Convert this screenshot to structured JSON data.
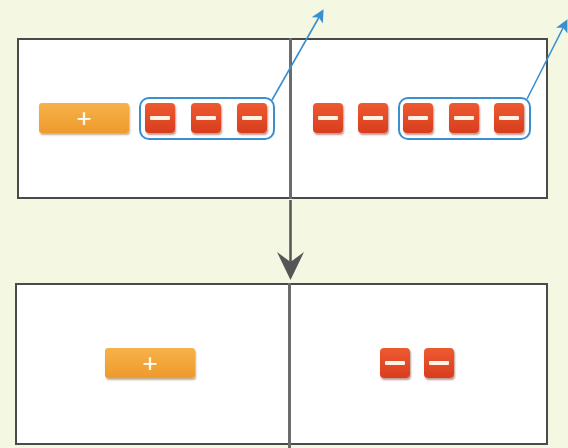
{
  "diagram": {
    "colors": {
      "background": "#f4f7e1",
      "panel": "#ffffff",
      "panel_border": "#4a4a4a",
      "positive_tile": "#f2a43a",
      "negative_tile": "#e04a25",
      "group_outline": "#3a8fd0",
      "flow_arrow": "#555555"
    },
    "before": {
      "left_side": {
        "tiles": [
          {
            "type": "x",
            "sign": "+",
            "label": "+"
          },
          {
            "type": "unit",
            "sign": "-",
            "label": "−"
          },
          {
            "type": "unit",
            "sign": "-",
            "label": "−"
          },
          {
            "type": "unit",
            "sign": "-",
            "label": "−"
          }
        ],
        "circled_count": 3
      },
      "right_side": {
        "tiles": [
          {
            "type": "unit",
            "sign": "-",
            "label": "−"
          },
          {
            "type": "unit",
            "sign": "-",
            "label": "−"
          },
          {
            "type": "unit",
            "sign": "-",
            "label": "−"
          },
          {
            "type": "unit",
            "sign": "-",
            "label": "−"
          },
          {
            "type": "unit",
            "sign": "-",
            "label": "−"
          }
        ],
        "circled_count": 3
      }
    },
    "after": {
      "left_side": {
        "tiles": [
          {
            "type": "x",
            "sign": "+",
            "label": "+"
          }
        ]
      },
      "right_side": {
        "tiles": [
          {
            "type": "unit",
            "sign": "-",
            "label": "−"
          },
          {
            "type": "unit",
            "sign": "-",
            "label": "−"
          }
        ]
      }
    }
  }
}
